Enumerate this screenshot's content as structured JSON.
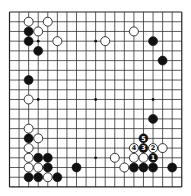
{
  "board": {
    "size": 19,
    "origin_x": 9.5,
    "origin_y": 12,
    "spacing_x": 9.57,
    "spacing_y": 9.72,
    "stone_radius": 4.5,
    "star_points": [
      [
        3,
        3
      ],
      [
        9,
        3
      ],
      [
        15,
        3
      ],
      [
        3,
        9
      ],
      [
        9,
        9
      ],
      [
        15,
        9
      ],
      [
        3,
        15
      ],
      [
        9,
        15
      ],
      [
        15,
        15
      ]
    ],
    "colors": {
      "line": "#333333",
      "black": "#111111",
      "white": "#ffffff",
      "background": "#ffffff"
    }
  },
  "stones": [
    {
      "x": 2,
      "y": 1,
      "color": "white"
    },
    {
      "x": 4,
      "y": 1,
      "color": "white"
    },
    {
      "x": 2,
      "y": 2,
      "color": "black"
    },
    {
      "x": 3,
      "y": 2,
      "color": "white"
    },
    {
      "x": 2,
      "y": 3,
      "color": "black"
    },
    {
      "x": 5,
      "y": 3,
      "color": "white"
    },
    {
      "x": 3,
      "y": 4,
      "color": "black"
    },
    {
      "x": 10,
      "y": 3,
      "color": "white"
    },
    {
      "x": 13,
      "y": 2,
      "color": "white"
    },
    {
      "x": 15,
      "y": 3,
      "color": "black"
    },
    {
      "x": 16,
      "y": 5,
      "color": "black"
    },
    {
      "x": 2,
      "y": 7,
      "color": "black"
    },
    {
      "x": 2,
      "y": 9,
      "color": "white"
    },
    {
      "x": 15,
      "y": 11,
      "color": "black"
    },
    {
      "x": 2,
      "y": 12,
      "color": "white"
    },
    {
      "x": 2,
      "y": 13,
      "color": "black"
    },
    {
      "x": 3,
      "y": 13,
      "color": "white"
    },
    {
      "x": 2,
      "y": 14,
      "color": "white"
    },
    {
      "x": 2,
      "y": 15,
      "color": "white"
    },
    {
      "x": 3,
      "y": 15,
      "color": "black"
    },
    {
      "x": 4,
      "y": 15,
      "color": "black"
    },
    {
      "x": 2,
      "y": 16,
      "color": "white"
    },
    {
      "x": 3,
      "y": 16,
      "color": "white"
    },
    {
      "x": 4,
      "y": 16,
      "color": "black"
    },
    {
      "x": 2,
      "y": 17,
      "color": "black"
    },
    {
      "x": 3,
      "y": 17,
      "color": "black"
    },
    {
      "x": 4,
      "y": 17,
      "color": "white"
    },
    {
      "x": 5,
      "y": 17,
      "color": "black"
    },
    {
      "x": 7,
      "y": 16,
      "color": "black"
    },
    {
      "x": 11,
      "y": 15,
      "color": "white"
    },
    {
      "x": 14,
      "y": 13,
      "color": "black",
      "label": "5"
    },
    {
      "x": 13,
      "y": 14,
      "color": "white",
      "label": "4"
    },
    {
      "x": 14,
      "y": 14,
      "color": "black",
      "label": "3"
    },
    {
      "x": 15,
      "y": 14,
      "color": "white",
      "label": "2"
    },
    {
      "x": 16,
      "y": 14,
      "color": "white"
    },
    {
      "x": 13,
      "y": 15,
      "color": "white"
    },
    {
      "x": 14,
      "y": 15,
      "color": "white"
    },
    {
      "x": 15,
      "y": 15,
      "color": "black",
      "label": "1"
    },
    {
      "x": 12,
      "y": 16,
      "color": "white"
    },
    {
      "x": 13,
      "y": 16,
      "color": "black"
    },
    {
      "x": 14,
      "y": 16,
      "color": "black"
    },
    {
      "x": 15,
      "y": 16,
      "color": "black"
    },
    {
      "x": 17,
      "y": 16,
      "color": "black"
    }
  ]
}
